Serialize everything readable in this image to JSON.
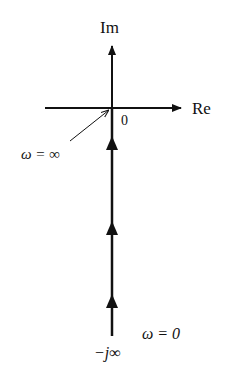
{
  "diagram": {
    "type": "nyquist-plot",
    "axes": {
      "imaginary_label": "Im",
      "real_label": "Re",
      "origin_label": "0"
    },
    "annotations": {
      "omega_infinity": "ω = ∞",
      "omega_zero": "ω = 0",
      "minus_j_infinity": "−j∞"
    },
    "path": {
      "description": "Locus along negative imaginary axis from −j∞ (ω=0) to origin (ω=∞)",
      "arrow_count": 3,
      "direction": "upward"
    },
    "colors": {
      "stroke": "#111111",
      "background": "#ffffff"
    }
  }
}
